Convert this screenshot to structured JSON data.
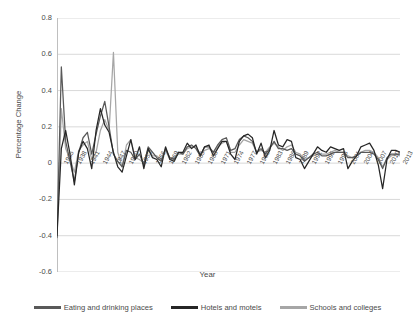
{
  "chart_data": {
    "type": "line",
    "title": "",
    "xlabel": "Year",
    "ylabel": "Percentage Change",
    "ylim": [
      -0.6,
      0.8
    ],
    "yticks": [
      "0.8",
      "0.6",
      "0.4",
      "0.2",
      "0",
      "-0.2",
      "-0.4",
      "-0.6"
    ],
    "ytick_values": [
      0.8,
      0.6,
      0.4,
      0.2,
      0,
      -0.2,
      -0.4,
      -0.6
    ],
    "grid": "horizontal",
    "legend_position": "bottom",
    "xtick_labels": [
      "1935",
      "1938",
      "1941",
      "1944",
      "1947",
      "1950",
      "1953",
      "1956",
      "1959",
      "1962",
      "1965",
      "1968",
      "1971",
      "1974",
      "1977",
      "1980",
      "1983",
      "1986",
      "1989",
      "1992",
      "1995",
      "1998",
      "2001",
      "2004",
      "2007",
      "2010",
      "2013"
    ],
    "x_start_year": 1934,
    "x_end_year": 2013,
    "x": [
      1934,
      1935,
      1936,
      1937,
      1938,
      1939,
      1940,
      1941,
      1942,
      1943,
      1944,
      1945,
      1946,
      1947,
      1948,
      1949,
      1950,
      1951,
      1952,
      1953,
      1954,
      1955,
      1956,
      1957,
      1958,
      1959,
      1960,
      1961,
      1962,
      1963,
      1964,
      1965,
      1966,
      1967,
      1968,
      1969,
      1970,
      1971,
      1972,
      1973,
      1974,
      1975,
      1976,
      1977,
      1978,
      1979,
      1980,
      1981,
      1982,
      1983,
      1984,
      1985,
      1986,
      1987,
      1988,
      1989,
      1990,
      1991,
      1992,
      1993,
      1994,
      1995,
      1996,
      1997,
      1998,
      1999,
      2000,
      2001,
      2002,
      2003,
      2004,
      2005,
      2006,
      2007,
      2008,
      2009,
      2010,
      2011,
      2012,
      2013
    ],
    "series": [
      {
        "name": "Eating and drinking places",
        "color": "#595959",
        "values": [
          -0.41,
          0.53,
          0.12,
          0.01,
          -0.1,
          0.06,
          0.14,
          0.17,
          0.05,
          0.16,
          0.26,
          0.34,
          0.2,
          0.05,
          0.01,
          -0.02,
          0.07,
          0.06,
          0.02,
          0.05,
          -0.01,
          0.09,
          0.06,
          0.03,
          0.01,
          0.08,
          0.03,
          0.02,
          0.06,
          0.05,
          0.09,
          0.1,
          0.08,
          0.04,
          0.09,
          0.09,
          0.06,
          0.1,
          0.13,
          0.14,
          0.07,
          0.08,
          0.13,
          0.15,
          0.14,
          0.12,
          0.06,
          0.08,
          0.05,
          0.08,
          0.12,
          0.08,
          0.08,
          0.07,
          0.08,
          0.05,
          0.04,
          0.01,
          0.03,
          0.05,
          0.06,
          0.04,
          0.04,
          0.05,
          0.06,
          0.06,
          0.06,
          0.03,
          0.03,
          0.04,
          0.06,
          0.06,
          0.06,
          0.05,
          0.02,
          -0.03,
          0.03,
          0.05,
          0.05,
          0.05
        ]
      },
      {
        "name": "Hotels and  motels",
        "color": "#262626",
        "values": [
          -0.4,
          0.08,
          0.18,
          0.05,
          -0.12,
          0.06,
          0.12,
          0.08,
          -0.03,
          0.18,
          0.3,
          0.21,
          0.17,
          0.06,
          -0.02,
          -0.05,
          0.04,
          0.13,
          0.02,
          0.09,
          -0.03,
          0.08,
          0.03,
          0.02,
          -0.02,
          0.09,
          0.02,
          0.01,
          0.06,
          0.06,
          0.11,
          0.08,
          0.1,
          0.04,
          0.09,
          0.1,
          0.04,
          0.08,
          0.12,
          0.12,
          0.05,
          0.02,
          0.12,
          0.15,
          0.16,
          0.14,
          0.05,
          0.11,
          0.03,
          0.07,
          0.18,
          0.1,
          0.09,
          0.13,
          0.12,
          0.03,
          0.02,
          -0.03,
          0.01,
          0.05,
          0.09,
          0.07,
          0.06,
          0.09,
          0.08,
          0.07,
          0.08,
          -0.03,
          0.01,
          0.04,
          0.09,
          0.1,
          0.11,
          0.07,
          -0.01,
          -0.14,
          0.02,
          0.07,
          0.07,
          0.06
        ]
      },
      {
        "name": "Schools and colleges",
        "color": "#a6a6a6",
        "values": [
          -0.41,
          0.3,
          0.08,
          0.02,
          -0.05,
          0.07,
          0.1,
          0.12,
          0.02,
          0.06,
          0.18,
          0.24,
          0.18,
          0.61,
          0.06,
          -0.02,
          0.1,
          0.13,
          0.03,
          0.02,
          0.0,
          0.08,
          0.04,
          0.04,
          0.02,
          0.07,
          0.02,
          0.03,
          0.05,
          0.05,
          0.08,
          0.09,
          0.09,
          0.05,
          0.07,
          0.08,
          0.06,
          0.09,
          0.11,
          0.12,
          0.06,
          0.06,
          0.1,
          0.13,
          0.12,
          0.11,
          0.06,
          0.07,
          0.06,
          0.09,
          0.11,
          0.09,
          0.07,
          0.09,
          0.1,
          0.06,
          0.05,
          0.02,
          0.03,
          0.04,
          0.05,
          0.05,
          0.05,
          0.06,
          0.07,
          0.06,
          0.06,
          0.04,
          0.03,
          0.04,
          0.06,
          0.07,
          0.07,
          0.06,
          0.03,
          -0.02,
          0.02,
          0.04,
          0.05,
          0.04
        ]
      }
    ]
  },
  "legend": {
    "items": [
      {
        "label": "Eating and drinking places",
        "color": "#595959"
      },
      {
        "label": "Hotels and  motels",
        "color": "#262626"
      },
      {
        "label": "Schools and colleges",
        "color": "#a6a6a6"
      }
    ]
  },
  "axes": {
    "y_title": "Percentage Change",
    "x_title": "Year"
  },
  "style": {
    "gridline_color": "#d9d9d9",
    "axis_line_color": "#bfbfbf",
    "background": "#ffffff",
    "text_color": "#4a4a4a"
  }
}
